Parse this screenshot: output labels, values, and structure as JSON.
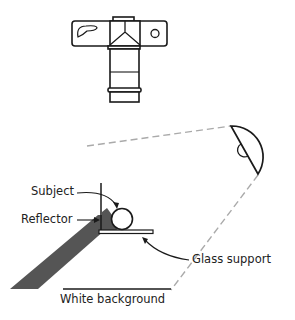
{
  "diagram": {
    "colors": {
      "line": "#1a1a1a",
      "light_path": "#aaaaaa",
      "shadow": "#555555",
      "background": "#ffffff"
    },
    "elements": {
      "camera": {
        "icon": "camera-icon"
      },
      "light": {
        "icon": "light-icon"
      },
      "subject": {
        "icon": "subject-sphere"
      }
    },
    "labels": {
      "subject": "Subject",
      "reflector": "Reflector",
      "glass_support": "Glass support",
      "white_background": "White background"
    }
  }
}
